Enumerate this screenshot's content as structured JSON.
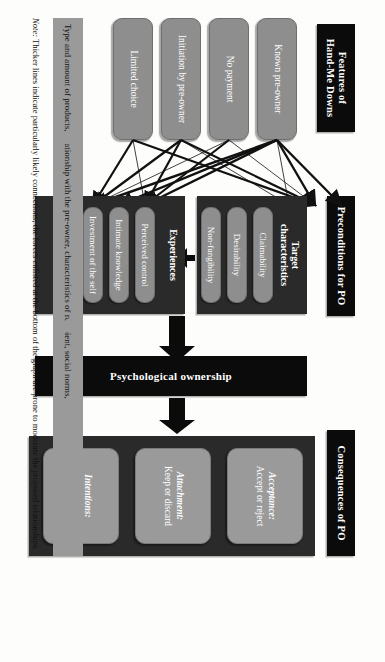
{
  "figure": {
    "sections": {
      "features": {
        "title": "Features of\nHand-Me Downs"
      },
      "preconditions": {
        "title": "Preconditions for PO"
      },
      "consequences": {
        "title": "Consequences of PO"
      }
    },
    "features": [
      {
        "label": "Known pre-owner"
      },
      {
        "label": "No payment"
      },
      {
        "label": "Initiation by pre-owner"
      },
      {
        "label": "Limited choice"
      }
    ],
    "target_characteristics": {
      "group_label": "Target\ncharacteristics",
      "items": [
        {
          "label": "Claimability"
        },
        {
          "label": "Desirability"
        },
        {
          "label": "Non-fungibility"
        }
      ]
    },
    "experiences": {
      "group_label": "Experiences",
      "items": [
        {
          "label": "Perceived control"
        },
        {
          "label": "Intimate knowledge"
        },
        {
          "label": "Investment of the self"
        }
      ]
    },
    "psychological_ownership": {
      "label": "Psychological ownership"
    },
    "consequences": [
      {
        "title": "Acceptance:",
        "detail": "Accept or reject"
      },
      {
        "title": "Attachment:",
        "detail": "Keep or discard"
      },
      {
        "title": "Intentions:",
        "detail": "Care or neglect"
      }
    ],
    "moderators": {
      "text": "Type and amount of products, relationship with the pre-owner, characteristics of recipient, social norms,"
    },
    "note": {
      "label": "Note:",
      "text": " Thicker lines indicate particularly likely connections; the forces enlisted at the bottom of the graph are prone to moderate the proposed relationships."
    },
    "colors": {
      "header_bar": "#0b0b0b",
      "group_panel": "#2a2a2a",
      "node": "#8e8e8e",
      "consequence_node": "#9a9a9a",
      "moderator_band": "#9a9a9a",
      "background": "#fdfdfb"
    }
  }
}
